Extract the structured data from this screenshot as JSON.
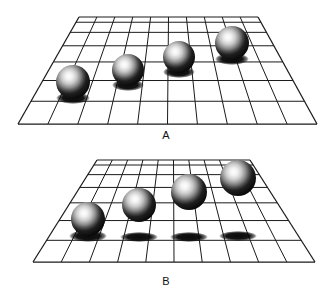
{
  "figure": {
    "background_color": "#ffffff",
    "ink_color": "#111111",
    "grid_line_color": "#1a1a1a",
    "sphere_dark_color": "#111111",
    "sphere_highlight_color": "#f2f2f2",
    "shadow_color": "#0d0d0d",
    "width": 333,
    "height": 292
  },
  "panels": [
    {
      "id": "A",
      "label": "A",
      "label_x": 166,
      "label_y": 139,
      "description": "Checkerboard ground plane in perspective with four spheres whose cast shadows are attached at the base of each sphere, so the spheres appear to rest on the ground and recede in depth.",
      "shadow_mode": "attached",
      "grid": {
        "columns": 10,
        "rows": 7,
        "top_left_x": 79,
        "top_right_x": 258,
        "bottom_left_x": 18,
        "bottom_right_x": 317,
        "top_y": 17,
        "bottom_y": 124
      },
      "spheres": [
        {
          "name": "sphere-a-1",
          "cx": 73,
          "cy": 82,
          "r": 17,
          "shadow_cx": 73,
          "shadow_cy": 98,
          "shadow_rx": 17,
          "shadow_ry": 6
        },
        {
          "name": "sphere-a-2",
          "cx": 128,
          "cy": 70,
          "r": 16,
          "shadow_cx": 128,
          "shadow_cy": 85,
          "shadow_rx": 16,
          "shadow_ry": 6
        },
        {
          "name": "sphere-a-3",
          "cx": 179,
          "cy": 57,
          "r": 16,
          "shadow_cx": 179,
          "shadow_cy": 72,
          "shadow_rx": 16,
          "shadow_ry": 6
        },
        {
          "name": "sphere-a-4",
          "cx": 232,
          "cy": 43,
          "r": 17,
          "shadow_cx": 232,
          "shadow_cy": 59,
          "shadow_rx": 17,
          "shadow_ry": 6
        }
      ]
    },
    {
      "id": "B",
      "label": "B",
      "label_x": 166,
      "label_y": 285,
      "description": "Identical ground plane and sphere image positions, but the cast shadows are displaced to a common near row of the ground plane, so the spheres appear to float at increasing heights above the plane.",
      "shadow_mode": "detached",
      "grid": {
        "columns": 10,
        "rows": 7,
        "top_left_x": 97,
        "top_right_x": 250,
        "bottom_left_x": 33,
        "bottom_right_x": 315,
        "top_y": 160,
        "bottom_y": 262
      },
      "spheres": [
        {
          "name": "sphere-b-1",
          "cx": 88,
          "cy": 219,
          "r": 17,
          "shadow_cx": 88,
          "shadow_cy": 236,
          "shadow_rx": 19,
          "shadow_ry": 6
        },
        {
          "name": "sphere-b-2",
          "cx": 139,
          "cy": 205,
          "r": 17,
          "shadow_cx": 139,
          "shadow_cy": 237,
          "shadow_rx": 19,
          "shadow_ry": 5
        },
        {
          "name": "sphere-b-3",
          "cx": 189,
          "cy": 192,
          "r": 18,
          "shadow_cx": 189,
          "shadow_cy": 237,
          "shadow_rx": 19,
          "shadow_ry": 5
        },
        {
          "name": "sphere-b-4",
          "cx": 238,
          "cy": 178,
          "r": 18,
          "shadow_cx": 238,
          "shadow_cy": 236,
          "shadow_rx": 19,
          "shadow_ry": 5
        }
      ]
    }
  ]
}
